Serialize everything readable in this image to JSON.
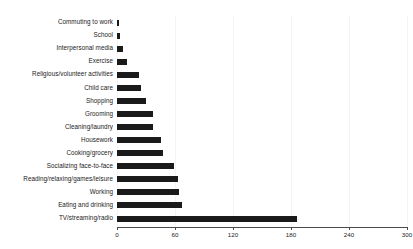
{
  "chart_data": {
    "type": "bar",
    "orientation": "horizontal",
    "title": "",
    "subtitle": "",
    "xlabel": "",
    "ylabel": "",
    "xlim": [
      0,
      300
    ],
    "xticks": [
      0,
      60,
      120,
      180,
      240,
      300
    ],
    "xtick_labels": [
      "0",
      "60",
      "120",
      "180",
      "240",
      "300"
    ],
    "grid": true,
    "grid_axis": "x",
    "legend": false,
    "legend_position": "none",
    "bar_color": "#1a1a1a",
    "categories": [
      "Commuting to work",
      "School",
      "Interpersonal media",
      "Exercise",
      "Religious/volunteer activities",
      "Child care",
      "Shopping",
      "Grooming",
      "Cleaning/laundry",
      "Housework",
      "Cooking/grocery",
      "Socializing face-to-face",
      "Reading/relaxing/games/leisure",
      "Working",
      "Eating and drinking",
      "TV/streaming/radio"
    ],
    "values": [
      2,
      3,
      6,
      10,
      23,
      25,
      30,
      37,
      37,
      45,
      48,
      59,
      63,
      64,
      67,
      186
    ]
  }
}
